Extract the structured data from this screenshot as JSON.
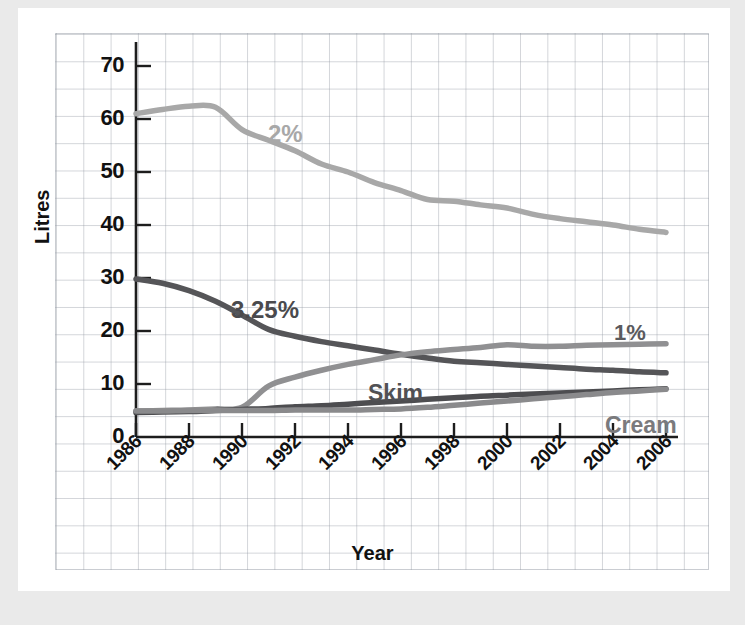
{
  "chart_data": {
    "type": "line",
    "title": "",
    "xlabel": "Year",
    "ylabel": "Litres",
    "xlim": [
      1986,
      2006
    ],
    "ylim": [
      0,
      75
    ],
    "yticks": [
      0,
      10,
      20,
      30,
      40,
      50,
      60,
      70
    ],
    "xticks": [
      1986,
      1988,
      1990,
      1992,
      1994,
      1996,
      1998,
      2000,
      2002,
      2004,
      2006
    ],
    "xtick_labels": [
      "1986",
      "1988",
      "1990",
      "1992",
      "1994",
      "1996",
      "1998",
      "2000",
      "2002",
      "2004",
      "2006"
    ],
    "ytick_labels": [
      "0",
      "10",
      "20",
      "30",
      "40",
      "50",
      "60",
      "70"
    ],
    "grid": true,
    "legend": "inline-annotations",
    "x": [
      1986,
      1987,
      1988,
      1989,
      1990,
      1991,
      1992,
      1993,
      1994,
      1995,
      1996,
      1997,
      1998,
      1999,
      2000,
      2001,
      2002,
      2003,
      2004,
      2005,
      2006
    ],
    "series": [
      {
        "name": "2%",
        "color": "#a8a8a8",
        "label": "2%",
        "label_color": "#a8a8a8",
        "values": [
          61.0,
          61.8,
          62.4,
          62.2,
          58.0,
          56.0,
          54.0,
          51.5,
          50.0,
          48.0,
          46.5,
          44.8,
          44.5,
          43.8,
          43.2,
          42.0,
          41.2,
          40.6,
          40.0,
          39.2,
          38.6
        ]
      },
      {
        "name": "3.25%",
        "color": "#555558",
        "label": "3.25%",
        "label_color": "#4a4a4d",
        "values": [
          29.8,
          29.0,
          27.6,
          25.6,
          23.0,
          20.3,
          19.0,
          18.0,
          17.2,
          16.4,
          15.6,
          14.9,
          14.3,
          14.0,
          13.7,
          13.4,
          13.1,
          12.8,
          12.6,
          12.3,
          12.1
        ]
      },
      {
        "name": "1%",
        "color": "#909092",
        "label": "1%",
        "label_color": "#5a5a5d",
        "values": [
          4.9,
          5.0,
          5.1,
          5.3,
          5.6,
          9.6,
          11.3,
          12.6,
          13.7,
          14.6,
          15.5,
          16.1,
          16.5,
          16.9,
          17.4,
          17.1,
          17.1,
          17.3,
          17.4,
          17.5,
          17.6
        ]
      },
      {
        "name": "Skim",
        "color": "#4d4d50",
        "label": "Skim",
        "label_color": "#515154",
        "values": [
          4.6,
          4.7,
          4.8,
          5.0,
          5.2,
          5.4,
          5.7,
          5.9,
          6.2,
          6.5,
          6.8,
          7.1,
          7.4,
          7.7,
          7.9,
          8.1,
          8.3,
          8.5,
          8.7,
          8.9,
          9.1
        ]
      },
      {
        "name": "Cream",
        "color": "#8a8a8c",
        "label": "Cream",
        "label_color": "#7a7a7d",
        "values": [
          4.9,
          4.9,
          5.0,
          5.0,
          5.0,
          5.0,
          5.1,
          5.1,
          5.1,
          5.2,
          5.3,
          5.6,
          6.0,
          6.4,
          6.8,
          7.2,
          7.6,
          8.0,
          8.4,
          8.7,
          9.0
        ]
      }
    ],
    "annotations": [
      {
        "text": "2%",
        "x_px": 268,
        "y_px": 120,
        "color": "#a8a8a8",
        "font_size": 24
      },
      {
        "text": "3.25%",
        "x_px": 231,
        "y_px": 296,
        "color": "#4a4a4d",
        "font_size": 24
      },
      {
        "text": "1%",
        "x_px": 614,
        "y_px": 320,
        "color": "#5a5a5d",
        "font_size": 22
      },
      {
        "text": "Skim",
        "x_px": 368,
        "y_px": 380,
        "color": "#515154",
        "font_size": 23
      },
      {
        "text": "Cream",
        "x_px": 605,
        "y_px": 412,
        "color": "#7a7a7d",
        "font_size": 23
      }
    ]
  },
  "axes": {
    "y_title": "Litres",
    "x_title": "Year"
  }
}
